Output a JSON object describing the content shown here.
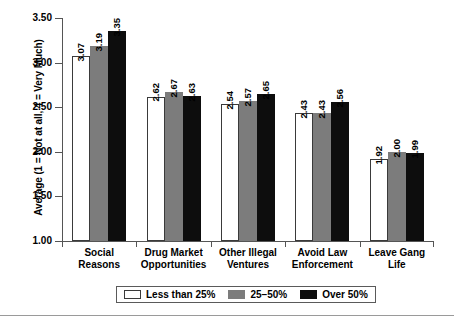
{
  "chart_data": {
    "type": "bar",
    "title": "",
    "xlabel": "",
    "ylabel": "Average (1 = Not at all, 4 = Very Much)",
    "ylim": [
      1.0,
      3.5
    ],
    "yticks": [
      "1.00",
      "1.50",
      "2.00",
      "2.50",
      "3.00",
      "3.50"
    ],
    "ytick_values": [
      1.0,
      1.5,
      2.0,
      2.5,
      3.0,
      3.5
    ],
    "grid": false,
    "legend_position": "bottom",
    "categories": [
      "Social Reasons",
      "Drug Market Opportunities",
      "Other Illegal Ventures",
      "Avoid Law Enforcement",
      "Leave Gang Life"
    ],
    "category_lines": [
      [
        "Social",
        "Reasons"
      ],
      [
        "Drug Market",
        "Opportunities"
      ],
      [
        "Other Illegal",
        "Ventures"
      ],
      [
        "Avoid Law",
        "Enforcement"
      ],
      [
        "Leave Gang",
        "Life"
      ]
    ],
    "series": [
      {
        "name": "Less than 25%",
        "color": "#ffffff",
        "values": [
          3.07,
          2.62,
          2.54,
          2.43,
          1.92
        ],
        "labels": [
          "3.07",
          "2.62",
          "2.54",
          "2.43",
          "1.92"
        ]
      },
      {
        "name": "25–50%",
        "color": "#7c7c7c",
        "values": [
          3.19,
          2.67,
          2.57,
          2.43,
          2.0
        ],
        "labels": [
          "3.19",
          "2.67",
          "2.57",
          "2.43",
          "2.00"
        ]
      },
      {
        "name": "Over 50%",
        "color": "#0d0d0d",
        "values": [
          3.35,
          2.63,
          2.65,
          2.56,
          1.99
        ],
        "labels": [
          "3.35",
          "2.63",
          "2.65",
          "2.56",
          "1.99"
        ]
      }
    ]
  },
  "legend": {
    "items": [
      {
        "label": "Less than 25%",
        "swatch": "c0"
      },
      {
        "label": "25–50%",
        "swatch": "c1"
      },
      {
        "label": "Over 50%",
        "swatch": "c2"
      }
    ]
  }
}
